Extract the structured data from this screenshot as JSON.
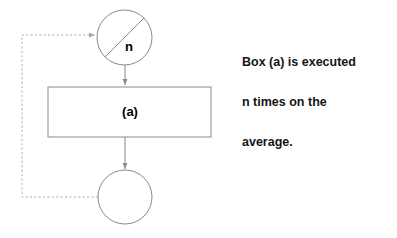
{
  "diagram": {
    "type": "flowchart",
    "title": "",
    "colors": {
      "stroke": "#8a8a8a",
      "dashed_stroke": "#b0b0b0",
      "text": "#000000",
      "annotation_text": "#151515",
      "background": "#ffffff"
    },
    "nodes": [
      {
        "id": "loop-decision",
        "shape": "circle-with-diagonal",
        "label": "n",
        "cx": 124.5,
        "cy": 37.5,
        "r": 27.5
      },
      {
        "id": "process-box",
        "shape": "rectangle",
        "label": "(a)",
        "x": 48,
        "y": 87,
        "width": 163,
        "height": 50
      },
      {
        "id": "loop-exit",
        "shape": "circle",
        "label": "",
        "cx": 125,
        "cy": 197,
        "r": 27
      }
    ],
    "edges": [
      {
        "id": "decision-to-box",
        "style": "solid",
        "arrow": true,
        "from": "loop-decision",
        "to": "process-box"
      },
      {
        "id": "box-to-exit",
        "style": "solid",
        "arrow": true,
        "from": "process-box",
        "to": "loop-exit"
      },
      {
        "id": "feedback-loop",
        "style": "dashed",
        "arrow": true,
        "from": "loop-exit",
        "to": "loop-decision"
      }
    ]
  },
  "annotation": {
    "lines": [
      "Box (a) is executed",
      "n times on the",
      "average."
    ]
  }
}
